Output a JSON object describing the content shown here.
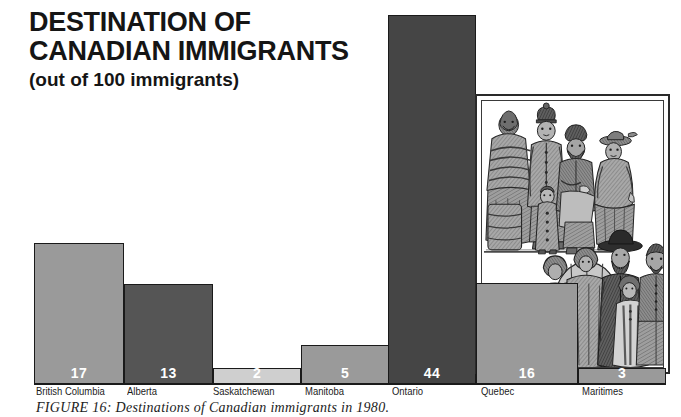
{
  "title": {
    "line1": "DESTINATION OF",
    "line2": "CANADIAN IMMIGRANTS",
    "subtitle": "(out of 100 immigrants)"
  },
  "caption": "FIGURE 16: Destinations of Canadian immigrants in 1980.",
  "illustration": {
    "alt_name": "immigrant-family-engraving",
    "description": "Black and white engraving of a group of immigrants in winter coats standing with luggage"
  },
  "colors": {
    "bar_light": "#cfcfcf",
    "bar_medium": "#9a9a9a",
    "bar_dark": "#555555",
    "bar_darkest": "#454545",
    "outline": "#1a1a1a",
    "text": "#1c1c1c",
    "value_text": "#ffffff"
  },
  "chart_data": {
    "type": "bar",
    "title": "DESTINATION OF CANADIAN IMMIGRANTS",
    "subtitle": "(out of 100 immigrants)",
    "xlabel": "",
    "ylabel": "Immigrants per 100",
    "ylim": [
      0,
      44
    ],
    "grid": false,
    "legend": "none",
    "categories": [
      "British Columbia",
      "Alberta",
      "Saskatchewan",
      "Manitoba",
      "Ontario",
      "Quebec",
      "Maritimes"
    ],
    "values": [
      17,
      13,
      2,
      5,
      44,
      16,
      3
    ],
    "value_labels": [
      "17",
      "13",
      "2",
      "5",
      "44",
      "16",
      "3"
    ],
    "bar_colors": [
      "#9a9a9a",
      "#555555",
      "#cfcfcf",
      "#9a9a9a",
      "#454545",
      "#9a9a9a",
      "#9a9a9a"
    ]
  },
  "bars": [
    {
      "label": "British Columbia",
      "value": "17",
      "color": "#9a9a9a",
      "left": 34,
      "width": 90,
      "top": 243,
      "label_left": 36
    },
    {
      "label": "Alberta",
      "value": "13",
      "color": "#555555",
      "left": 124,
      "width": 89,
      "top": 284,
      "label_left": 127
    },
    {
      "label": "Saskatchewan",
      "value": "2",
      "color": "#cfcfcf",
      "left": 213,
      "width": 88,
      "top": 368,
      "label_left": 213
    },
    {
      "label": "Manitoba",
      "value": "5",
      "color": "#9a9a9a",
      "left": 301,
      "width": 88,
      "top": 345,
      "label_left": 305
    },
    {
      "label": "Ontario",
      "value": "44",
      "color": "#454545",
      "left": 388,
      "width": 88,
      "top": 15,
      "label_left": 392
    },
    {
      "label": "Quebec",
      "value": "16",
      "color": "#9a9a9a",
      "left": 476,
      "width": 102,
      "top": 283,
      "label_left": 481
    },
    {
      "label": "Maritimes",
      "value": "3",
      "color": "#9a9a9a",
      "left": 578,
      "width": 88,
      "top": 368,
      "label_left": 582
    }
  ]
}
